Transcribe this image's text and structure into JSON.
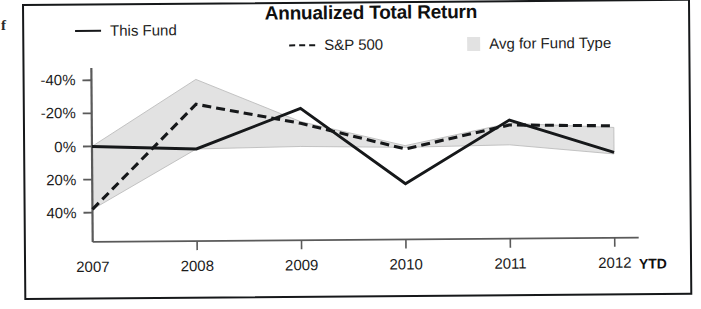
{
  "figure": {
    "title": "Annualized Total Return",
    "page_bleed_glyph": "f"
  },
  "legend": {
    "items": [
      {
        "label": "This Fund",
        "marker": "solid-line-swatch",
        "color": "#16181a"
      },
      {
        "label": "S&P 500",
        "marker": "dashed-line-swatch",
        "color": "#16181a"
      },
      {
        "label": "Avg for Fund Type",
        "marker": "shaded-band-swatch",
        "color": "#e2e2e2"
      }
    ]
  },
  "axes": {
    "y_ticks": [
      "40%",
      "20%",
      "0%",
      "-20%",
      "-40%"
    ],
    "x_ticks": [
      "2007",
      "2008",
      "2009",
      "2010",
      "2011",
      "2012"
    ],
    "x_suffix": "YTD"
  },
  "colors": {
    "line": "#16181a",
    "band": "#e2e2e2",
    "band_edge": "#bdbdbd",
    "axis": "#5a5a5a",
    "frame": "#16181a"
  },
  "chart_data": {
    "type": "line",
    "title": "Annualized Total Return",
    "xlabel": "",
    "ylabel": "",
    "categories": [
      "2007",
      "2008",
      "2009",
      "2010",
      "2011",
      "2012 YTD"
    ],
    "ylim": [
      -45,
      45
    ],
    "yticks": [
      -40,
      -20,
      0,
      20,
      40
    ],
    "ytick_labels": [
      "-40%",
      "-20%",
      "0%",
      "20%",
      "40%"
    ],
    "grid": false,
    "legend_position": "top",
    "series": [
      {
        "name": "This Fund",
        "style": "solid",
        "color": "#16181a",
        "values": [
          0,
          -2,
          22,
          -24,
          14,
          -6
        ]
      },
      {
        "name": "S&P 500",
        "style": "dashed",
        "color": "#16181a",
        "values": [
          -38,
          25,
          13,
          -3,
          11,
          10
        ]
      },
      {
        "name": "Avg for Fund Type",
        "style": "band",
        "color": "#e2e2e2",
        "band_upper": [
          0,
          40,
          14,
          -1,
          12,
          9
        ],
        "band_lower": [
          -38,
          -2,
          -1,
          -2,
          -1,
          -7
        ]
      }
    ],
    "annotations": [
      {
        "text": "YTD",
        "at": "2012",
        "bold": true
      }
    ]
  }
}
